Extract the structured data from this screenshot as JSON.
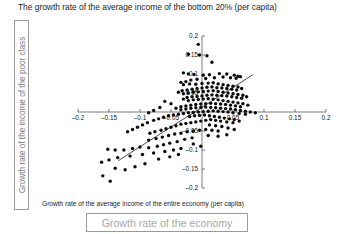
{
  "title": "The growth rate of the average income of the bottom 20% (per capita)",
  "left_label_box": {
    "text": "Growth rate of the income of the poor class",
    "border_color": "#9a9a9a",
    "text_color": "#7b7b7b"
  },
  "bottom_label_box": {
    "text": "Growth rate of the economy",
    "border_color": "#9a9a9a",
    "text_color": "#a8a8a8"
  },
  "chart_data": {
    "type": "scatter",
    "title": "The growth rate of the average income of the bottom 20% (per capita)",
    "xlabel": "Growth rate of the average income of the entire economy (per capita)",
    "ylabel": "The growth rate of the average income of the bottom 20% (per capita)",
    "xlim": [
      -0.2,
      0.2
    ],
    "ylim": [
      -0.2,
      0.2
    ],
    "xticks": [
      -0.2,
      -0.15,
      -0.1,
      -0.05,
      0.05,
      0.1,
      0.15,
      0.2
    ],
    "yticks": [
      0.2,
      0.15,
      0.1,
      0.05,
      -0.05,
      -0.1,
      -0.15,
      -0.2
    ],
    "xticklabels": [
      "–0.2",
      "–0.15",
      "–0.1",
      "–0.05",
      "0.05",
      "0.1",
      "0.15",
      "0.2"
    ],
    "yticklabels": [
      "0.2",
      "0.15",
      "0.1",
      "0.05",
      "–0.05",
      "–0.1",
      "–0.15",
      "–0.2"
    ],
    "grid": false,
    "legend": null,
    "axes_style": "crossed-at-origin",
    "marker": {
      "shape": "circle",
      "color": "#0b0b0b",
      "size": 1.7
    },
    "trendline": {
      "type": "linear",
      "color": "#1a1a1a",
      "x_start": -0.135,
      "y_start": -0.128,
      "x_end": 0.082,
      "y_end": 0.098
    },
    "points": [
      [
        -0.006,
        0.178
      ],
      [
        -0.022,
        0.152
      ],
      [
        -0.004,
        0.15
      ],
      [
        0.008,
        0.148
      ],
      [
        0.016,
        0.131
      ],
      [
        -0.03,
        0.103
      ],
      [
        -0.022,
        0.1
      ],
      [
        -0.013,
        0.099
      ],
      [
        0.002,
        0.097
      ],
      [
        0.012,
        0.098
      ],
      [
        0.028,
        0.101
      ],
      [
        0.04,
        0.1
      ],
      [
        0.052,
        0.097
      ],
      [
        0.058,
        0.094
      ],
      [
        0.062,
        0.093
      ],
      [
        0.055,
        0.089
      ],
      [
        0.046,
        0.09
      ],
      [
        0.034,
        0.092
      ],
      [
        0.02,
        0.09
      ],
      [
        0.006,
        0.088
      ],
      [
        -0.008,
        0.086
      ],
      [
        -0.018,
        0.084
      ],
      [
        -0.026,
        0.08
      ],
      [
        -0.034,
        0.078
      ],
      [
        -0.03,
        0.072
      ],
      [
        -0.02,
        0.074
      ],
      [
        -0.01,
        0.073
      ],
      [
        0.0,
        0.075
      ],
      [
        0.01,
        0.076
      ],
      [
        0.018,
        0.077
      ],
      [
        0.026,
        0.074
      ],
      [
        0.034,
        0.072
      ],
      [
        0.042,
        0.07
      ],
      [
        0.05,
        0.068
      ],
      [
        0.058,
        0.066
      ],
      [
        0.064,
        0.062
      ],
      [
        0.056,
        0.058
      ],
      [
        0.048,
        0.06
      ],
      [
        0.04,
        0.062
      ],
      [
        0.032,
        0.063
      ],
      [
        0.024,
        0.064
      ],
      [
        0.016,
        0.066
      ],
      [
        0.008,
        0.065
      ],
      [
        0.0,
        0.063
      ],
      [
        -0.008,
        0.062
      ],
      [
        -0.016,
        0.06
      ],
      [
        -0.024,
        0.058
      ],
      [
        -0.032,
        0.056
      ],
      [
        -0.038,
        0.052
      ],
      [
        -0.03,
        0.048
      ],
      [
        -0.022,
        0.05
      ],
      [
        -0.014,
        0.052
      ],
      [
        -0.006,
        0.053
      ],
      [
        0.002,
        0.054
      ],
      [
        0.01,
        0.055
      ],
      [
        0.018,
        0.056
      ],
      [
        0.026,
        0.054
      ],
      [
        0.034,
        0.052
      ],
      [
        0.042,
        0.05
      ],
      [
        0.05,
        0.048
      ],
      [
        0.058,
        0.046
      ],
      [
        0.066,
        0.044
      ],
      [
        0.072,
        0.04
      ],
      [
        0.064,
        0.036
      ],
      [
        0.056,
        0.038
      ],
      [
        0.048,
        0.04
      ],
      [
        0.04,
        0.042
      ],
      [
        0.032,
        0.043
      ],
      [
        0.024,
        0.044
      ],
      [
        0.016,
        0.045
      ],
      [
        0.008,
        0.044
      ],
      [
        0.0,
        0.042
      ],
      [
        -0.008,
        0.041
      ],
      [
        -0.016,
        0.04
      ],
      [
        -0.024,
        0.038
      ],
      [
        -0.03,
        0.034
      ],
      [
        -0.022,
        0.03
      ],
      [
        -0.014,
        0.032
      ],
      [
        -0.006,
        0.033
      ],
      [
        0.002,
        0.034
      ],
      [
        0.01,
        0.035
      ],
      [
        0.018,
        0.034
      ],
      [
        0.026,
        0.032
      ],
      [
        0.034,
        0.03
      ],
      [
        0.042,
        0.028
      ],
      [
        0.05,
        0.026
      ],
      [
        0.058,
        0.024
      ],
      [
        0.066,
        0.022
      ],
      [
        0.074,
        0.018
      ],
      [
        0.062,
        0.014
      ],
      [
        0.054,
        0.016
      ],
      [
        0.046,
        0.018
      ],
      [
        0.038,
        0.02
      ],
      [
        0.03,
        0.021
      ],
      [
        0.022,
        0.022
      ],
      [
        0.014,
        0.023
      ],
      [
        0.006,
        0.022
      ],
      [
        -0.002,
        0.021
      ],
      [
        -0.01,
        0.02
      ],
      [
        -0.018,
        0.018
      ],
      [
        -0.026,
        0.016
      ],
      [
        -0.034,
        0.014
      ],
      [
        -0.042,
        0.01
      ],
      [
        -0.05,
        0.022
      ],
      [
        -0.06,
        0.028
      ],
      [
        -0.068,
        0.012
      ],
      [
        -0.078,
        0.004
      ],
      [
        -0.086,
        -0.002
      ],
      [
        -0.034,
        0.006
      ],
      [
        -0.026,
        0.008
      ],
      [
        -0.018,
        0.01
      ],
      [
        -0.01,
        0.011
      ],
      [
        -0.002,
        0.012
      ],
      [
        0.006,
        0.013
      ],
      [
        0.014,
        0.012
      ],
      [
        0.022,
        0.011
      ],
      [
        0.03,
        0.01
      ],
      [
        0.038,
        0.009
      ],
      [
        0.046,
        0.008
      ],
      [
        0.054,
        0.006
      ],
      [
        0.062,
        0.004
      ],
      [
        0.07,
        0.002
      ],
      [
        0.078,
        0.0
      ],
      [
        0.086,
        -0.002
      ],
      [
        0.07,
        -0.006
      ],
      [
        0.06,
        -0.004
      ],
      [
        0.05,
        -0.002
      ],
      [
        0.042,
        0.0
      ],
      [
        0.034,
        0.001
      ],
      [
        0.026,
        0.002
      ],
      [
        0.018,
        0.003
      ],
      [
        0.01,
        0.002
      ],
      [
        0.002,
        0.001
      ],
      [
        -0.006,
        0.0
      ],
      [
        -0.014,
        -0.001
      ],
      [
        -0.022,
        -0.002
      ],
      [
        -0.03,
        -0.004
      ],
      [
        -0.038,
        -0.006
      ],
      [
        -0.046,
        -0.008
      ],
      [
        -0.054,
        -0.01
      ],
      [
        -0.062,
        -0.014
      ],
      [
        -0.07,
        -0.018
      ],
      [
        -0.078,
        -0.022
      ],
      [
        -0.088,
        -0.028
      ],
      [
        -0.096,
        -0.034
      ],
      [
        -0.104,
        -0.04
      ],
      [
        -0.112,
        -0.046
      ],
      [
        -0.12,
        -0.052
      ],
      [
        -0.02,
        -0.012
      ],
      [
        -0.012,
        -0.01
      ],
      [
        -0.004,
        -0.009
      ],
      [
        0.004,
        -0.008
      ],
      [
        0.012,
        -0.01
      ],
      [
        0.02,
        -0.012
      ],
      [
        0.028,
        -0.014
      ],
      [
        0.036,
        -0.016
      ],
      [
        0.044,
        -0.018
      ],
      [
        0.052,
        -0.02
      ],
      [
        0.06,
        -0.024
      ],
      [
        0.05,
        -0.028
      ],
      [
        0.04,
        -0.026
      ],
      [
        0.03,
        -0.024
      ],
      [
        0.022,
        -0.022
      ],
      [
        0.014,
        -0.02
      ],
      [
        0.006,
        -0.022
      ],
      [
        -0.002,
        -0.024
      ],
      [
        -0.01,
        -0.026
      ],
      [
        -0.018,
        -0.028
      ],
      [
        -0.026,
        -0.03
      ],
      [
        -0.034,
        -0.032
      ],
      [
        -0.042,
        -0.036
      ],
      [
        -0.05,
        -0.04
      ],
      [
        -0.058,
        -0.044
      ],
      [
        -0.066,
        -0.048
      ],
      [
        -0.076,
        -0.052
      ],
      [
        -0.084,
        -0.056
      ],
      [
        0.012,
        -0.034
      ],
      [
        0.022,
        -0.036
      ],
      [
        0.032,
        -0.038
      ],
      [
        0.042,
        -0.042
      ],
      [
        0.052,
        -0.046
      ],
      [
        0.026,
        -0.05
      ],
      [
        0.016,
        -0.048
      ],
      [
        0.006,
        -0.046
      ],
      [
        -0.004,
        -0.048
      ],
      [
        -0.014,
        -0.05
      ],
      [
        -0.024,
        -0.052
      ],
      [
        -0.034,
        -0.056
      ],
      [
        -0.044,
        -0.058
      ],
      [
        -0.054,
        -0.062
      ],
      [
        -0.064,
        -0.066
      ],
      [
        -0.074,
        -0.07
      ],
      [
        -0.086,
        -0.074
      ],
      [
        0.01,
        -0.062
      ],
      [
        0.026,
        -0.064
      ],
      [
        0.04,
        -0.06
      ],
      [
        -0.016,
        -0.068
      ],
      [
        -0.028,
        -0.072
      ],
      [
        -0.04,
        -0.078
      ],
      [
        -0.052,
        -0.082
      ],
      [
        -0.062,
        -0.086
      ],
      [
        -0.072,
        -0.09
      ],
      [
        -0.086,
        -0.094
      ],
      [
        -0.1,
        -0.092
      ],
      [
        -0.112,
        -0.096
      ],
      [
        -0.126,
        -0.1
      ],
      [
        -0.14,
        -0.1
      ],
      [
        -0.152,
        -0.098
      ],
      [
        -0.014,
        -0.084
      ],
      [
        -0.002,
        -0.09
      ],
      [
        -0.034,
        -0.096
      ],
      [
        -0.046,
        -0.1
      ],
      [
        -0.06,
        -0.104
      ],
      [
        -0.078,
        -0.108
      ],
      [
        -0.096,
        -0.112
      ],
      [
        -0.116,
        -0.116
      ],
      [
        -0.136,
        -0.12
      ],
      [
        -0.15,
        -0.126
      ],
      [
        -0.162,
        -0.132
      ],
      [
        -0.14,
        -0.148
      ],
      [
        -0.124,
        -0.152
      ],
      [
        -0.108,
        -0.144
      ],
      [
        -0.16,
        -0.168
      ],
      [
        -0.148,
        -0.182
      ],
      [
        -0.092,
        -0.136
      ],
      [
        -0.07,
        -0.124
      ],
      [
        -0.052,
        -0.118
      ],
      [
        -0.038,
        -0.112
      ]
    ]
  }
}
